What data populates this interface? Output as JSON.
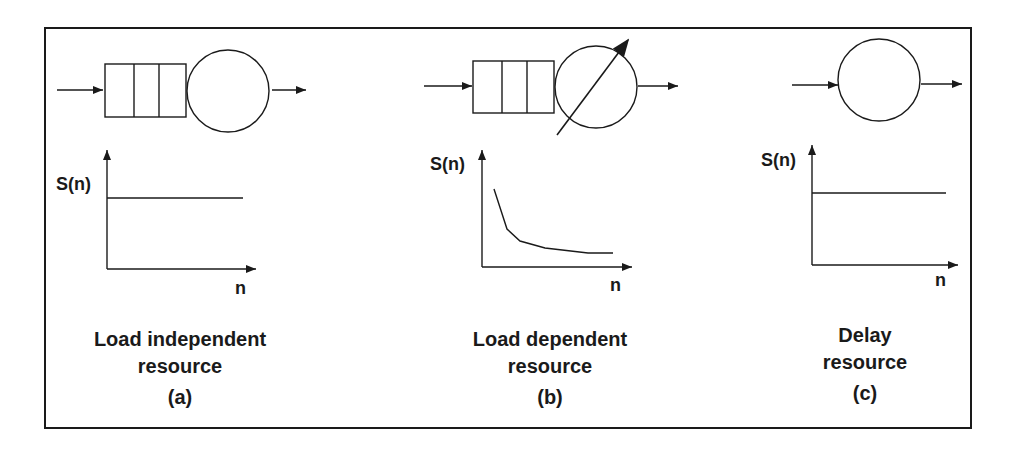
{
  "panels": [
    {
      "id": "a",
      "title_line1": "Load independent",
      "title_line2": "resource",
      "tag": "(a)",
      "queue_slots": 3,
      "server": "fixed-rate",
      "y_label": "S(n)",
      "x_label": "n",
      "curve": "constant"
    },
    {
      "id": "b",
      "title_line1": "Load dependent",
      "title_line2": "resource",
      "tag": "(b)",
      "queue_slots": 3,
      "server": "variable-rate",
      "y_label": "S(n)",
      "x_label": "n",
      "curve": "decreasing"
    },
    {
      "id": "c",
      "title_line1": "Delay",
      "title_line2": "resource",
      "tag": "(c)",
      "queue_slots": 0,
      "server": "delay",
      "y_label": "S(n)",
      "x_label": "n",
      "curve": "constant"
    }
  ],
  "colors": {
    "stroke": "#1a1a1a",
    "background": "#ffffff"
  }
}
